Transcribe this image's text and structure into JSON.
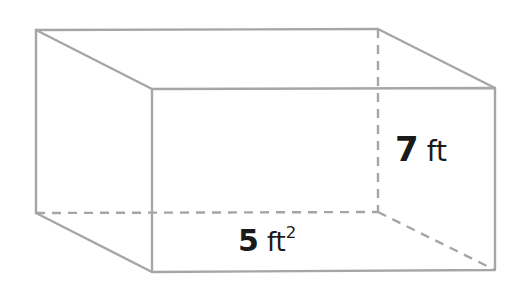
{
  "diagram": {
    "type": "rectangular-prism",
    "stroke_color": "#a6a6a6",
    "background": "#ffffff",
    "labels": {
      "height": {
        "value": "7",
        "unit": "ft",
        "superscript": ""
      },
      "base_area": {
        "value": "5",
        "unit": "ft",
        "superscript": "2"
      }
    },
    "vertices": {
      "back_top_left": [
        36,
        30
      ],
      "back_top_right": [
        378,
        29
      ],
      "front_top_left": [
        152,
        89
      ],
      "front_top_right": [
        495,
        88
      ],
      "back_bottom_left": [
        36,
        213
      ],
      "back_bottom_right": [
        378,
        212
      ],
      "front_bottom_left": [
        152,
        272
      ],
      "front_bottom_right": [
        495,
        270
      ]
    }
  }
}
